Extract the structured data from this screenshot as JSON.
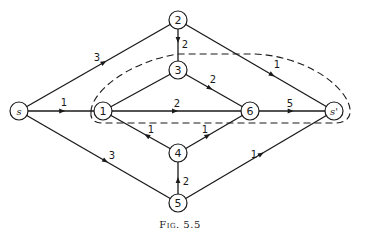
{
  "figure": {
    "caption": "Fig. 5.5",
    "nodes": [
      {
        "id": "s",
        "label": "s"
      },
      {
        "id": "1",
        "label": "1"
      },
      {
        "id": "2",
        "label": "2"
      },
      {
        "id": "3",
        "label": "3"
      },
      {
        "id": "4",
        "label": "4"
      },
      {
        "id": "5",
        "label": "5"
      },
      {
        "id": "6",
        "label": "6"
      },
      {
        "id": "s'",
        "label": "s'"
      }
    ],
    "edges": [
      {
        "from": "s",
        "to": "2",
        "capacity": "3"
      },
      {
        "from": "s",
        "to": "1",
        "capacity": "1"
      },
      {
        "from": "s",
        "to": "5",
        "capacity": "3"
      },
      {
        "from": "2",
        "to": "3",
        "capacity": "2"
      },
      {
        "from": "2",
        "to": "s'",
        "capacity": "1"
      },
      {
        "from": "1",
        "to": "3",
        "capacity": ""
      },
      {
        "from": "3",
        "to": "6",
        "capacity": "2"
      },
      {
        "from": "1",
        "to": "6",
        "capacity": "2"
      },
      {
        "from": "4",
        "to": "1",
        "capacity": "1"
      },
      {
        "from": "4",
        "to": "6",
        "capacity": "1"
      },
      {
        "from": "5",
        "to": "4",
        "capacity": "2"
      },
      {
        "from": "5",
        "to": "s'",
        "capacity": "1"
      },
      {
        "from": "6",
        "to": "s'",
        "capacity": "5"
      }
    ],
    "cut_set": {
      "style": "dashed",
      "encloses": [
        "1",
        "3",
        "6",
        "s'"
      ]
    }
  }
}
